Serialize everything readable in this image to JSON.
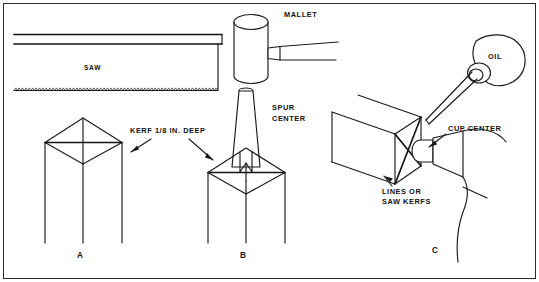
{
  "figure": {
    "border": true,
    "line_color": "#1a1a1a",
    "background": "#ffffff"
  },
  "labels": {
    "saw": "SAW",
    "mallet": "MALLET",
    "spur_center_line1": "SPUR",
    "spur_center_line2": "CENTER",
    "kerf": "KERF 1/8 IN. DEEP",
    "oil": "OIL",
    "cup_center": "CUP CENTER",
    "lines_or_line1": "LINES OR",
    "lines_or_line2": "SAW KERFS"
  },
  "panels": [
    {
      "id": "A",
      "label": "A",
      "caption": "Stock end marked with diagonal saw kerfs"
    },
    {
      "id": "B",
      "label": "B",
      "caption": "Spur center driven into kerfs with mallet"
    },
    {
      "id": "C",
      "label": "C",
      "caption": "Oil applied to cup center end of stock"
    }
  ],
  "objects": [
    {
      "name": "handsaw",
      "panel": "A",
      "detail": "back saw with toothed lower edge"
    },
    {
      "name": "square-post-a",
      "panel": "A",
      "detail": "stock end with crossed kerf lines"
    },
    {
      "name": "mallet",
      "panel": "B",
      "detail": "cylindrical mallet head with tapered handle"
    },
    {
      "name": "spur-center",
      "panel": "B",
      "detail": "tapered shaft with spurs seated in kerfs"
    },
    {
      "name": "square-post-b",
      "panel": "B",
      "detail": "stock with spur center set in end"
    },
    {
      "name": "oil-can",
      "panel": "C",
      "detail": "oil can with long tapered spout"
    },
    {
      "name": "square-post-c",
      "panel": "C",
      "detail": "horizontal stock end with kerf lines"
    },
    {
      "name": "cup-center",
      "panel": "C",
      "detail": "tailstock cup center bearing on stock end"
    }
  ]
}
